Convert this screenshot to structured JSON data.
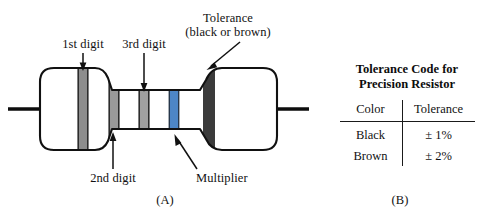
{
  "figure": {
    "panel_a_label": "(A)",
    "panel_b_label": "(B)",
    "resistor": {
      "labels": {
        "first_digit": "1st digit",
        "second_digit": "2nd digit",
        "third_digit": "3rd digit",
        "multiplier": "Multiplier",
        "tolerance_line1": "Tolerance",
        "tolerance_line2": "(black or brown)"
      },
      "bands": [
        {
          "name": "1st-digit-band",
          "color": "#8d8d8d",
          "x": 79,
          "width": 8
        },
        {
          "name": "2nd-digit-band",
          "color": "#9a9a9a",
          "x": 110,
          "width": 8
        },
        {
          "name": "3rd-digit-band",
          "color": "#a0a0a0",
          "x": 140,
          "width": 8
        },
        {
          "name": "multiplier-band",
          "color": "#4d86c6",
          "x": 170,
          "width": 8
        },
        {
          "name": "tolerance-band",
          "color": "#3b3b3b",
          "x": 203,
          "width": 12
        }
      ],
      "body_color": "#ffffff",
      "outline_color": "#111111",
      "lead_color": "#0d0d0d"
    }
  },
  "table": {
    "title_line1": "Tolerance Code for",
    "title_line2": "Precision Resistor",
    "headers": [
      "Color",
      "Tolerance"
    ],
    "rows": [
      [
        "Black",
        "± 1%"
      ],
      [
        "Brown",
        "± 2%"
      ]
    ]
  }
}
